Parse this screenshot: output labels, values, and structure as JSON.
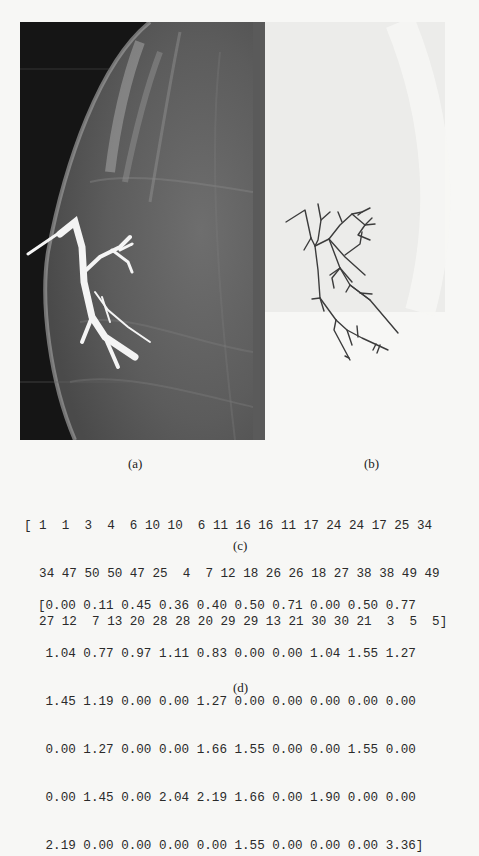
{
  "figure": {
    "panels": [
      {
        "id": "a",
        "label": "(a)",
        "content": "mammogram-galactogram-image"
      },
      {
        "id": "b",
        "label": "(b)",
        "content": "ductal-tree-skeleton"
      }
    ]
  },
  "sequence_c": {
    "label": "(c)",
    "lines": [
      "[ 1  1  3  4  6 10 10  6 11 16 16 11 17 24 24 17 25 34",
      "  34 47 50 50 47 25  4  7 12 18 26 26 18 27 38 38 49 49",
      "  27 12  7 13 20 28 28 20 29 29 13 21 30 30 21  3  5  5]"
    ],
    "values": [
      1,
      1,
      3,
      4,
      6,
      10,
      10,
      6,
      11,
      16,
      16,
      11,
      17,
      24,
      24,
      17,
      25,
      34,
      34,
      47,
      50,
      50,
      47,
      25,
      4,
      7,
      12,
      18,
      26,
      26,
      18,
      27,
      38,
      38,
      49,
      49,
      27,
      12,
      7,
      13,
      20,
      28,
      28,
      20,
      29,
      29,
      13,
      21,
      30,
      30,
      21,
      3,
      5,
      5
    ]
  },
  "matrix_d": {
    "label": "(d)",
    "lines": [
      "[0.00 0.11 0.45 0.36 0.40 0.50 0.71 0.00 0.50 0.77",
      " 1.04 0.77 0.97 1.11 0.83 0.00 0.00 1.04 1.55 1.27",
      " 1.45 1.19 0.00 0.00 1.27 0.00 0.00 0.00 0.00 0.00",
      " 0.00 1.27 0.00 0.00 1.66 1.55 0.00 0.00 1.55 0.00",
      " 0.00 1.45 0.00 2.04 2.19 1.66 0.00 1.90 0.00 0.00",
      " 2.19 0.00 0.00 0.00 0.00 1.55 0.00 0.00 0.00 3.36]"
    ],
    "rows": [
      [
        0.0,
        0.11,
        0.45,
        0.36,
        0.4,
        0.5,
        0.71,
        0.0,
        0.5,
        0.77
      ],
      [
        1.04,
        0.77,
        0.97,
        1.11,
        0.83,
        0.0,
        0.0,
        1.04,
        1.55,
        1.27
      ],
      [
        1.45,
        1.19,
        0.0,
        0.0,
        1.27,
        0.0,
        0.0,
        0.0,
        0.0,
        0.0
      ],
      [
        0.0,
        1.27,
        0.0,
        0.0,
        1.66,
        1.55,
        0.0,
        0.0,
        1.55,
        0.0
      ],
      [
        0.0,
        1.45,
        0.0,
        2.04,
        2.19,
        1.66,
        0.0,
        1.9,
        0.0,
        0.0
      ],
      [
        2.19,
        0.0,
        0.0,
        0.0,
        0.0,
        1.55,
        0.0,
        0.0,
        0.0,
        3.36
      ]
    ]
  },
  "colors": {
    "page_background": "#f7f7f5",
    "mammogram_background": "#3a3a3a",
    "tree_stroke": "#3c3c3c",
    "text": "#222222"
  }
}
